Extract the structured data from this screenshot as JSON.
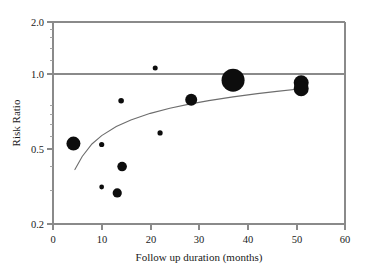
{
  "chart_data": {
    "type": "scatter",
    "title": "",
    "subtitle": "",
    "xlabel": "Follow up duration (months)",
    "ylabel": "Risk Ratio",
    "xlim": [
      0,
      60
    ],
    "ylim": [
      0.2,
      2.0
    ],
    "yscale": "log",
    "xscale": "linear",
    "grid": false,
    "legend": null,
    "legend_position": "none",
    "xticks": [
      0,
      10,
      20,
      30,
      40,
      50,
      60
    ],
    "xtick_labels": [
      "0",
      "10",
      "20",
      "30",
      "40",
      "50",
      "60"
    ],
    "yticks": [
      0.2,
      0.5,
      1.0,
      2.0
    ],
    "ytick_labels": [
      "0.2",
      "0.5",
      "1.0",
      "2.0"
    ],
    "yticks_minor": [
      0.3,
      0.4,
      0.6,
      0.7,
      0.8,
      0.9,
      1.2,
      1.4,
      1.6,
      1.8
    ],
    "reference_line": {
      "axis": "y",
      "value": 1.0,
      "label": "null effect (RR = 1.0)"
    },
    "marker_color": "#0d0d0d",
    "marker_size_meaning": "study weight",
    "points": [
      {
        "x": 4.2,
        "y": 0.5,
        "size": 7.0
      },
      {
        "x": 10.0,
        "y": 0.495,
        "size": 2.6
      },
      {
        "x": 10.0,
        "y": 0.305,
        "size": 2.4
      },
      {
        "x": 13.2,
        "y": 0.285,
        "size": 4.6
      },
      {
        "x": 14.2,
        "y": 0.385,
        "size": 4.8
      },
      {
        "x": 14.0,
        "y": 0.815,
        "size": 2.8
      },
      {
        "x": 21.0,
        "y": 1.185,
        "size": 2.5
      },
      {
        "x": 22.0,
        "y": 0.565,
        "size": 2.6
      },
      {
        "x": 28.4,
        "y": 0.825,
        "size": 6.0
      },
      {
        "x": 37.0,
        "y": 1.03,
        "size": 11.5
      },
      {
        "x": 51.0,
        "y": 1.0,
        "size": 7.5
      },
      {
        "x": 51.0,
        "y": 0.935,
        "size": 7.5
      }
    ],
    "trend_curve": {
      "description": "fitted meta-regression line of risk ratio on follow up duration",
      "x": [
        4.5,
        6,
        8,
        10,
        13,
        16,
        20,
        24,
        28,
        32,
        37,
        42,
        46,
        51
      ],
      "y": [
        0.372,
        0.432,
        0.498,
        0.548,
        0.608,
        0.655,
        0.706,
        0.748,
        0.784,
        0.816,
        0.852,
        0.884,
        0.907,
        0.934
      ]
    }
  }
}
